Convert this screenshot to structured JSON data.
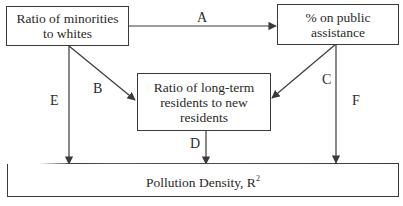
{
  "diagram": {
    "nodes": {
      "minorities": "Ratio of minorities to whites",
      "minorities_line1": "Ratio of minorities",
      "minorities_line2": "to whites",
      "assistance_line1": "% on public",
      "assistance_line2": "assistance",
      "residents_line1": "Ratio of long-term",
      "residents_line2": "residents to new",
      "residents_line3": "residents",
      "pollution": "Pollution Density, R",
      "pollution_sup": "2"
    },
    "edges": [
      {
        "label": "A",
        "from": "minorities",
        "to": "assistance"
      },
      {
        "label": "B",
        "from": "minorities",
        "to": "residents"
      },
      {
        "label": "C",
        "from": "assistance",
        "to": "residents"
      },
      {
        "label": "D",
        "from": "residents",
        "to": "pollution"
      },
      {
        "label": "E",
        "from": "minorities",
        "to": "pollution"
      },
      {
        "label": "F",
        "from": "assistance",
        "to": "pollution"
      }
    ],
    "edge_labels": {
      "A": "A",
      "B": "B",
      "C": "C",
      "D": "D",
      "E": "E",
      "F": "F"
    },
    "colors": {
      "line": "#3a3a3a",
      "text": "#2a2a2a",
      "background": "#ffffff"
    }
  }
}
